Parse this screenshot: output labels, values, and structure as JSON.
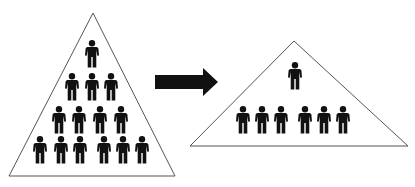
{
  "diagram": {
    "colors": {
      "background": "#ffffff",
      "outline": "#555555",
      "figure": "#111111",
      "arrow": "#111111"
    },
    "before": {
      "name": "tall-hierarchy",
      "triangle": {
        "apex": [
          93,
          13
        ],
        "base_left": [
          9,
          176
        ],
        "base_right": [
          175,
          176
        ]
      },
      "levels": [
        {
          "count": 1,
          "y": 40,
          "x": [
            92
          ]
        },
        {
          "count": 3,
          "y": 73,
          "x": [
            72,
            92,
            111
          ]
        },
        {
          "count": 4,
          "y": 106,
          "x": [
            59,
            79,
            100,
            121
          ]
        },
        {
          "count": 6,
          "y": 136,
          "x": [
            40,
            61,
            80,
            104,
            123,
            142
          ]
        }
      ]
    },
    "arrow": {
      "x1": 155,
      "x2": 218,
      "y": 82,
      "direction": "right"
    },
    "after": {
      "name": "flat-hierarchy",
      "triangle": {
        "apex": [
          294,
          41
        ],
        "base_left": [
          190,
          146
        ],
        "base_right": [
          408,
          146
        ]
      },
      "levels": [
        {
          "count": 1,
          "y": 62,
          "x": [
            295
          ]
        },
        {
          "count": 6,
          "y": 106,
          "x": [
            243,
            262,
            281,
            305,
            324,
            343
          ]
        }
      ]
    }
  }
}
